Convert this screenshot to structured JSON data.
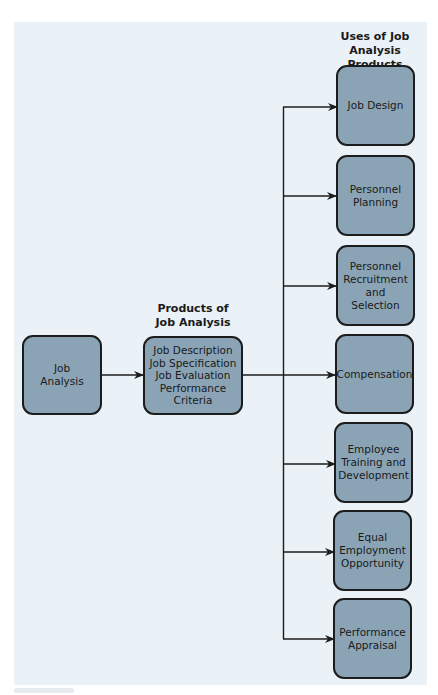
{
  "diagram": {
    "type": "flowchart",
    "colors": {
      "panel_background": "#eaf2f7",
      "box_fill": "#8aa4b6",
      "box_border": "#1c1c1c",
      "connector": "#1c1c1c"
    },
    "headings": {
      "products": "Products of\nJob Analysis",
      "uses": "Uses of Job\nAnalysis Products"
    },
    "source": {
      "label": "Job\nAnalysis"
    },
    "products": {
      "label": "Job Description\nJob Specification\nJob Evaluation\nPerformance\nCriteria",
      "items": [
        "Job Description",
        "Job Specification",
        "Job Evaluation",
        "Performance Criteria"
      ]
    },
    "uses": [
      {
        "label": "Job Design"
      },
      {
        "label": "Personnel\nPlanning"
      },
      {
        "label": "Personnel\nRecruitment\nand Selection"
      },
      {
        "label": "Compensation"
      },
      {
        "label": "Employee\nTraining and\nDevelopment"
      },
      {
        "label": "Equal\nEmployment\nOpportunity"
      },
      {
        "label": "Performance\nAppraisal"
      }
    ],
    "edges": [
      {
        "from": "Job Analysis",
        "to": "Products of Job Analysis"
      },
      {
        "from": "Products of Job Analysis",
        "to": "Job Design"
      },
      {
        "from": "Products of Job Analysis",
        "to": "Personnel Planning"
      },
      {
        "from": "Products of Job Analysis",
        "to": "Personnel Recruitment and Selection"
      },
      {
        "from": "Products of Job Analysis",
        "to": "Compensation"
      },
      {
        "from": "Products of Job Analysis",
        "to": "Employee Training and Development"
      },
      {
        "from": "Products of Job Analysis",
        "to": "Equal Employment Opportunity"
      },
      {
        "from": "Products of Job Analysis",
        "to": "Performance Appraisal"
      }
    ]
  }
}
